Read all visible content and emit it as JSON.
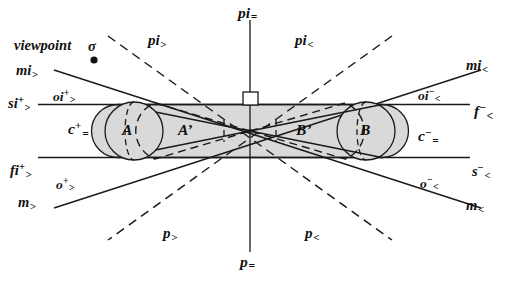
{
  "figure": {
    "width": 509,
    "height": 286,
    "background": "#ffffff",
    "line_color": "#1a1a1a",
    "fill_color": "#d9d9d9"
  },
  "viewpoint": {
    "label": "viewpoint",
    "symbol": "σ",
    "x": 93,
    "y": 57
  },
  "body_labels": [
    {
      "name": "circle-a",
      "text": "A",
      "x": 128,
      "y": 124
    },
    {
      "name": "ellipse-a-prime",
      "text": "A’",
      "x": 186,
      "y": 124
    },
    {
      "name": "ellipse-b-prime",
      "text": "B’",
      "x": 303,
      "y": 124
    },
    {
      "name": "circle-b",
      "text": "B",
      "x": 364,
      "y": 124
    }
  ],
  "axis_labels": {
    "pi_eq": {
      "base": "pi",
      "sub": "="
    },
    "p_eq": {
      "base": "p",
      "sub": "="
    }
  },
  "region_labels": [
    {
      "name": "region-pi-gt",
      "base": "pi",
      "sup": "",
      "sub": ">"
    },
    {
      "name": "region-pi-lt",
      "base": "pi",
      "sup": "",
      "sub": "<"
    },
    {
      "name": "region-p-gt",
      "base": "p",
      "sup": "",
      "sub": ">"
    },
    {
      "name": "region-p-lt",
      "base": "p",
      "sup": "",
      "sub": "<"
    },
    {
      "name": "region-c-plus-eq",
      "base": "c",
      "sup": "+",
      "sub": "="
    },
    {
      "name": "region-c-minus-eq",
      "base": "c",
      "sup": "−",
      "sub": "="
    }
  ],
  "ray_labels": [
    {
      "name": "ray-mi-gt",
      "base": "mi",
      "sup": "",
      "sub": ">"
    },
    {
      "name": "ray-mi-lt",
      "base": "mi",
      "sup": "",
      "sub": "<"
    },
    {
      "name": "ray-si-plus-gt",
      "base": "si",
      "sup": "+",
      "sub": ">"
    },
    {
      "name": "ray-oi-plus-gt",
      "base": "oi",
      "sup": "+",
      "sub": ">"
    },
    {
      "name": "ray-oi-minus-lt",
      "base": "oi",
      "sup": "−",
      "sub": "<"
    },
    {
      "name": "ray-f-minus-lt",
      "base": "f",
      "sup": "−",
      "sub": "<"
    },
    {
      "name": "ray-fi-plus-gt",
      "base": "fi",
      "sup": "+",
      "sub": ">"
    },
    {
      "name": "ray-o-plus-gt",
      "base": "o",
      "sup": "+",
      "sub": ">"
    },
    {
      "name": "ray-o-minus-lt",
      "base": "o",
      "sup": "−",
      "sub": "<"
    },
    {
      "name": "ray-s-minus-lt",
      "base": "s",
      "sup": "−",
      "sub": "<"
    },
    {
      "name": "ray-m-gt",
      "base": "m",
      "sup": "",
      "sub": ">"
    },
    {
      "name": "ray-m-lt",
      "base": "m",
      "sup": "",
      "sub": "<"
    }
  ],
  "text": {
    "viewpoint_word": "viewpoint",
    "sigma": "σ",
    "A": "A",
    "A_prime": "A’",
    "B": "B",
    "B_prime": "B’",
    "pi": "pi",
    "p": "p",
    "c": "c",
    "mi": "mi",
    "si": "si",
    "oi": "oi",
    "fi": "fi",
    "f": "f",
    "o": "o",
    "s": "s",
    "m": "m",
    "gt": ">",
    "lt": "<",
    "eq": "=",
    "plus": "+",
    "minus": "−",
    "empty": ""
  }
}
